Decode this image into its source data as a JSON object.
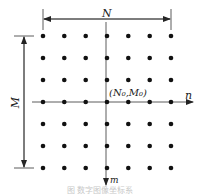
{
  "diagram": {
    "labels": {
      "width": "N",
      "height": "M",
      "origin": "(N₀,M₀)",
      "x_axis": "n",
      "y_axis": "m"
    },
    "grid": {
      "columns": 7,
      "rows": 7
    },
    "caption": "图 数字图像坐标系"
  }
}
